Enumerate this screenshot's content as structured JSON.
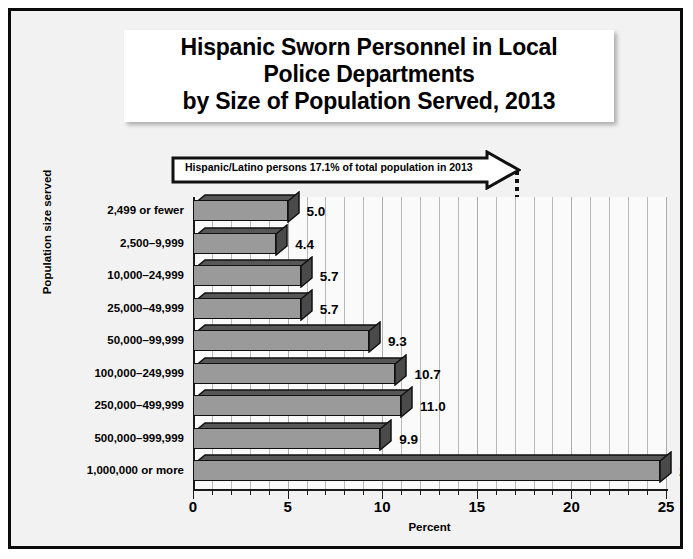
{
  "title": {
    "lines": [
      "Hispanic Sworn Personnel in Local",
      "Police Departments",
      "by Size of Population Served, 2013"
    ]
  },
  "annotation": {
    "text": "Hispanic/Latino persons 17.1% of total population in 2013",
    "value": 17.1
  },
  "axes": {
    "xlabel": "Percent",
    "ylabel": "Population size served",
    "xticks": [
      "0",
      "5",
      "10",
      "15",
      "20",
      "25"
    ]
  },
  "colors": {
    "bar_front": "#9a9a9a",
    "bar_top": "#575757",
    "bar_side": "#4a4a4a",
    "outline": "#111111",
    "plot_background": "#fafafa",
    "slide_background": "#f2f2f2",
    "frame": "#0a0a0a",
    "gridline": "#b9b9b9"
  },
  "chart_data": {
    "type": "bar",
    "orientation": "horizontal",
    "title": "Hispanic Sworn Personnel in Local Police Departments by Size of Population Served, 2013",
    "xlabel": "Percent",
    "ylabel": "Population size served",
    "xlim": [
      0,
      25
    ],
    "xticks": [
      0,
      5,
      10,
      15,
      20,
      25
    ],
    "grid": true,
    "legend": "none",
    "categories": [
      "2,499 or fewer",
      "2,500–9,999",
      "10,000–24,999",
      "25,000–49,999",
      "50,000–99,999",
      "100,000–249,999",
      "250,000–499,999",
      "500,000–999,999",
      "1,000,000 or more"
    ],
    "values": [
      5.0,
      4.4,
      5.7,
      5.7,
      9.3,
      10.7,
      11.0,
      9.9,
      24.7
    ],
    "value_labels": [
      "5.0",
      "4.4",
      "5.7",
      "5.7",
      "9.3",
      "10.7",
      "11.0",
      "9.9",
      "24.7"
    ],
    "annotations": [
      {
        "type": "reference-line",
        "value": 17.1,
        "style": "dotted",
        "label": "Hispanic/Latino persons 17.1% of total population in 2013"
      }
    ]
  }
}
